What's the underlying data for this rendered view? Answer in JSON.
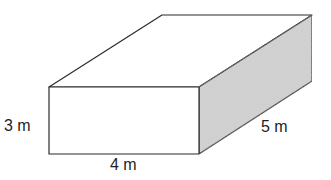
{
  "figure": {
    "type": "rectangular-prism",
    "colors": {
      "edge": "#2b2b2b",
      "front_face": "#ffffff",
      "top_face": "#ffffff",
      "side_face": "#cdcdcd",
      "label_text": "#1e1e1e"
    },
    "labels": {
      "height": "3 m",
      "width": "4 m",
      "depth": "5 m"
    }
  }
}
